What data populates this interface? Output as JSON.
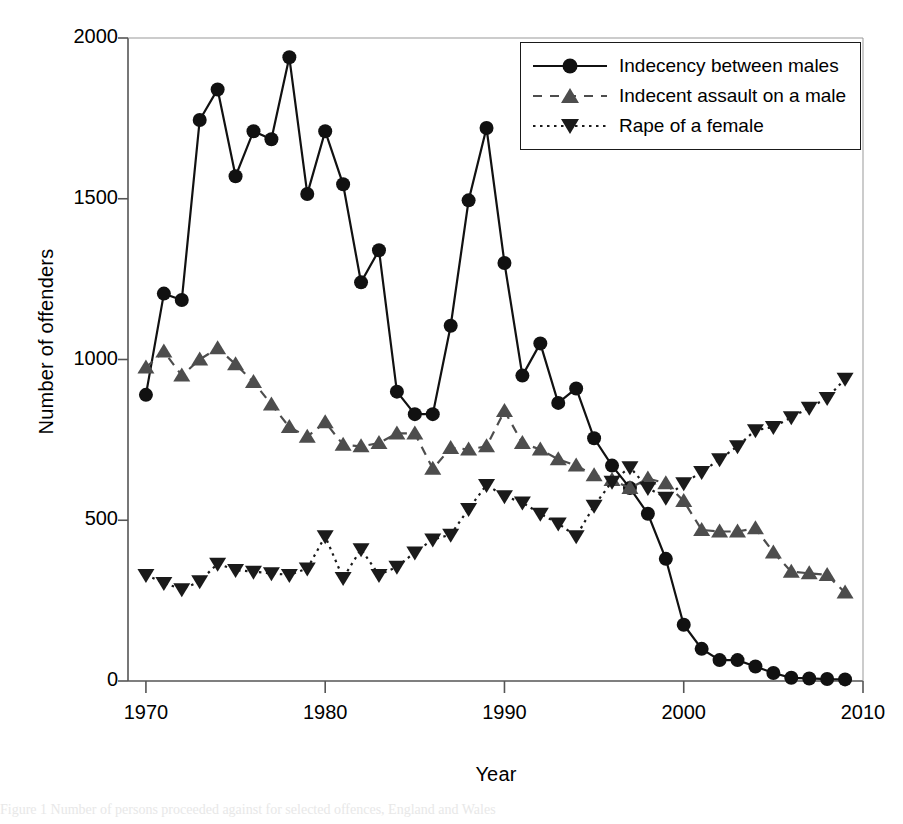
{
  "chart_data": {
    "type": "line",
    "title": "",
    "xlabel": "Year",
    "ylabel": "Number of offenders",
    "xlim": [
      1969,
      2010
    ],
    "ylim": [
      0,
      2000
    ],
    "xticks": [
      1970,
      1980,
      1990,
      2000,
      2010
    ],
    "yticks": [
      0,
      500,
      1000,
      1500,
      2000
    ],
    "grid": false,
    "legend_position": "top-right",
    "x": [
      1970,
      1971,
      1972,
      1973,
      1974,
      1975,
      1976,
      1977,
      1978,
      1979,
      1980,
      1981,
      1982,
      1983,
      1984,
      1985,
      1986,
      1987,
      1988,
      1989,
      1990,
      1991,
      1992,
      1993,
      1994,
      1995,
      1996,
      1997,
      1998,
      1999,
      2000,
      2001,
      2002,
      2003,
      2004,
      2005,
      2006,
      2007,
      2008,
      2009
    ],
    "series": [
      {
        "name": "Indecency between males",
        "marker": "circle",
        "linestyle": "solid",
        "color": "#111111",
        "values": [
          890,
          1205,
          1185,
          1745,
          1840,
          1570,
          1710,
          1685,
          1940,
          1515,
          1710,
          1545,
          1240,
          1340,
          900,
          830,
          830,
          1105,
          1495,
          1720,
          1300,
          950,
          1050,
          865,
          910,
          755,
          670,
          600,
          520,
          380,
          175,
          100,
          65,
          65,
          45,
          25,
          10,
          8,
          6,
          5
        ]
      },
      {
        "name": "Indecent assault on a male",
        "marker": "triangle-up",
        "linestyle": "dashed",
        "color": "#4d4d4d",
        "values": [
          975,
          1025,
          950,
          1000,
          1035,
          985,
          930,
          860,
          790,
          760,
          805,
          735,
          730,
          740,
          770,
          770,
          660,
          725,
          720,
          730,
          840,
          740,
          720,
          690,
          670,
          640,
          625,
          600,
          630,
          615,
          560,
          470,
          465,
          465,
          475,
          400,
          340,
          335,
          330,
          275
        ]
      },
      {
        "name": "Rape of a female",
        "marker": "triangle-down",
        "linestyle": "dotted",
        "color": "#1a1a1a",
        "values": [
          330,
          305,
          285,
          310,
          365,
          345,
          340,
          335,
          330,
          350,
          450,
          320,
          410,
          330,
          355,
          400,
          440,
          455,
          535,
          610,
          575,
          555,
          520,
          490,
          450,
          545,
          620,
          665,
          600,
          570,
          615,
          650,
          690,
          730,
          780,
          790,
          820,
          850,
          880,
          940
        ]
      }
    ]
  },
  "legend": {
    "entries": [
      {
        "label": "Indecency between males"
      },
      {
        "label": "Indecent assault on a male"
      },
      {
        "label": "Rape of a female"
      }
    ]
  },
  "axes": {
    "x_title": "Year",
    "y_title": "Number of offenders",
    "x_tick_labels": [
      "1970",
      "1980",
      "1990",
      "2000",
      "2010"
    ],
    "y_tick_labels": [
      "0",
      "500",
      "1000",
      "1500",
      "2000"
    ]
  },
  "caption": {
    "text": "Figure 1 Number of persons proceeded against for selected offences, England and Wales"
  }
}
